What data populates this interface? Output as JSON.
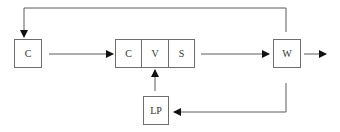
{
  "diagram": {
    "nodes": {
      "c_left": "C",
      "cvs": {
        "c": "C",
        "v": "V",
        "s": "S"
      },
      "w": "W",
      "lp": "LP"
    },
    "edges": [
      {
        "from": "C",
        "to": "CVS"
      },
      {
        "from": "CVS",
        "to": "W"
      },
      {
        "from": "W",
        "to": "output"
      },
      {
        "from": "W",
        "to": "C",
        "route": "top feedback"
      },
      {
        "from": "W",
        "to": "LP",
        "route": "bottom"
      },
      {
        "from": "LP",
        "to": "V"
      }
    ],
    "colors": {
      "line": "#5a5a5a",
      "arrow": "#111111",
      "box_border": "#6e6e6e"
    }
  }
}
